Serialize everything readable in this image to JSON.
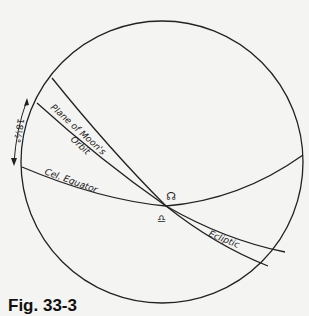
{
  "diagram": {
    "circles": {
      "label": "Celestial sphere"
    },
    "lines": {
      "moon_orbit": "Plane of Moon's",
      "moon_orbit_2": "Orbit",
      "equator": "Cel. Equator",
      "ecliptic": "Ecliptic"
    },
    "angle_label": "18½°",
    "node_symbol": "☊",
    "libra_symbol": "♎︎"
  },
  "caption": "Fig. 33-3"
}
